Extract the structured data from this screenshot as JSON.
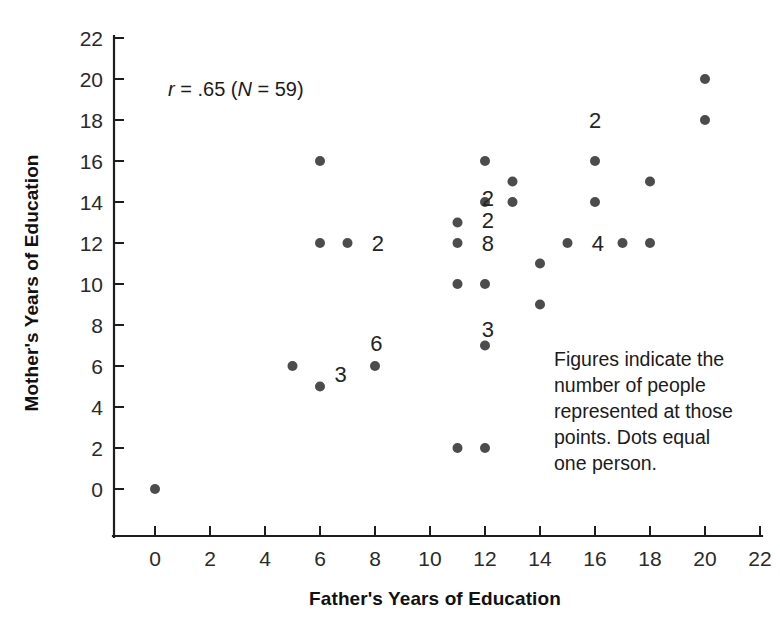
{
  "chart_data": {
    "type": "scatter",
    "title": "",
    "xlabel": "Father's Years of Education",
    "ylabel": "Mother's Years of Education",
    "xlim": [
      -1,
      22
    ],
    "ylim": [
      -1,
      22
    ],
    "xticks": [
      0,
      2,
      4,
      6,
      8,
      10,
      12,
      14,
      16,
      18,
      20,
      22
    ],
    "yticks": [
      0,
      2,
      4,
      6,
      8,
      10,
      12,
      14,
      16,
      18,
      20,
      22
    ],
    "xtick_labels": [
      "0",
      "2",
      "4",
      "6",
      "8",
      "10",
      "12",
      "14",
      "16",
      "18",
      "20",
      "22"
    ],
    "ytick_labels": [
      "0",
      "2",
      "4",
      "6",
      "8",
      "10",
      "12",
      "14",
      "16",
      "18",
      "20",
      "22"
    ],
    "grid": false,
    "legend": false,
    "marker_color": "#4c4c4c",
    "marker_size": 9,
    "points": [
      {
        "x": 0,
        "y": 0,
        "n": 1
      },
      {
        "x": 5,
        "y": 6,
        "n": 3
      },
      {
        "x": 6,
        "y": 5,
        "n": 1
      },
      {
        "x": 6,
        "y": 12,
        "n": 1
      },
      {
        "x": 6,
        "y": 16,
        "n": 1
      },
      {
        "x": 7,
        "y": 12,
        "n": 2
      },
      {
        "x": 8,
        "y": 6,
        "n": 6
      },
      {
        "x": 11,
        "y": 2,
        "n": 1
      },
      {
        "x": 11,
        "y": 10,
        "n": 1
      },
      {
        "x": 11,
        "y": 12,
        "n": 8
      },
      {
        "x": 11,
        "y": 13,
        "n": 2
      },
      {
        "x": 12,
        "y": 2,
        "n": 1
      },
      {
        "x": 12,
        "y": 7,
        "n": 3
      },
      {
        "x": 12,
        "y": 10,
        "n": 1
      },
      {
        "x": 12,
        "y": 14,
        "n": 2
      },
      {
        "x": 12,
        "y": 16,
        "n": 1
      },
      {
        "x": 13,
        "y": 14,
        "n": 1
      },
      {
        "x": 13,
        "y": 15,
        "n": 1
      },
      {
        "x": 14,
        "y": 9,
        "n": 1
      },
      {
        "x": 14,
        "y": 11,
        "n": 1
      },
      {
        "x": 15,
        "y": 12,
        "n": 4
      },
      {
        "x": 16,
        "y": 14,
        "n": 1
      },
      {
        "x": 16,
        "y": 16,
        "n": 2
      },
      {
        "x": 17,
        "y": 12,
        "n": 1
      },
      {
        "x": 18,
        "y": 12,
        "n": 1
      },
      {
        "x": 18,
        "y": 15,
        "n": 1
      },
      {
        "x": 20,
        "y": 18,
        "n": 1
      },
      {
        "x": 20,
        "y": 20,
        "n": 1
      }
    ],
    "count_labels": [
      {
        "x": 6.75,
        "y": 5.6,
        "text": "3"
      },
      {
        "x": 8.1,
        "y": 12.0,
        "text": "2"
      },
      {
        "x": 8.05,
        "y": 7.1,
        "text": "6"
      },
      {
        "x": 12.1,
        "y": 7.8,
        "text": "3"
      },
      {
        "x": 12.1,
        "y": 12.0,
        "text": "8"
      },
      {
        "x": 12.1,
        "y": 13.1,
        "text": "2"
      },
      {
        "x": 12.1,
        "y": 14.2,
        "text": "2"
      },
      {
        "x": 16.1,
        "y": 12.0,
        "text": "4"
      },
      {
        "x": 16.0,
        "y": 18.0,
        "text": "2"
      }
    ]
  },
  "annotations": {
    "stat_r_symbol": "r",
    "stat_r_value": " = .65 (",
    "stat_n_symbol": "N",
    "stat_n_value": " = 59)",
    "stat_full": "r = .65 (N = 59)",
    "note_lines": [
      "Figures indicate the",
      "number of people",
      "represented at those",
      "points. Dots equal",
      "one person."
    ]
  }
}
